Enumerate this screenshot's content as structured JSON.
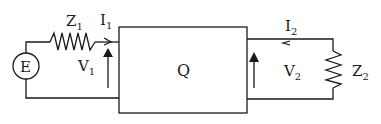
{
  "diagram": {
    "type": "two-port network circuit",
    "source": {
      "label": "E"
    },
    "source_impedance": {
      "label": "Z",
      "subscript": "1"
    },
    "input_current": {
      "label": "I",
      "subscript": "1"
    },
    "input_voltage": {
      "label": "V",
      "subscript": "1"
    },
    "network": {
      "label": "Q"
    },
    "output_current": {
      "label": "I",
      "subscript": "2"
    },
    "output_voltage": {
      "label": "V",
      "subscript": "2"
    },
    "load_impedance": {
      "label": "Z",
      "subscript": "2"
    },
    "colors": {
      "line": "#1a1a1a",
      "background": "#ffffff"
    }
  }
}
